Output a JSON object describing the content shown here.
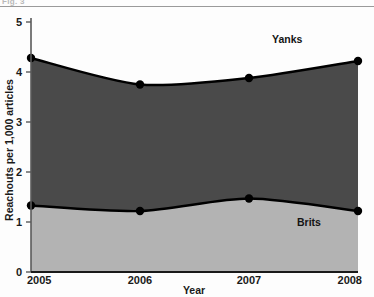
{
  "figure": {
    "caption_remnant": "Fig. 3",
    "background_color": "#fdfdfd"
  },
  "chart_data": {
    "type": "area",
    "stacked": true,
    "title": "",
    "subtitle": "",
    "xlabel": "Year",
    "ylabel": "Reachouts per 1,000 articles",
    "x": [
      2005,
      2006,
      2007,
      2008
    ],
    "xticklabels": [
      "2005",
      "2006",
      "2007",
      "2008"
    ],
    "yticklabels": [
      "0",
      "1",
      "2",
      "3",
      "4",
      "5"
    ],
    "yticks": [
      0,
      1,
      2,
      3,
      4,
      5
    ],
    "xlim": [
      2005,
      2008
    ],
    "ylim": [
      0,
      5
    ],
    "grid": false,
    "legend_position": "inline-annotation",
    "markers": "filled-circle",
    "series": [
      {
        "name": "Brits",
        "values": [
          1.33,
          1.22,
          1.47,
          1.22
        ],
        "color": "#b3b3b3",
        "line_color": "#000000",
        "label_x": 2007.55,
        "label_y": 0.92
      },
      {
        "name": "Yanks",
        "values": [
          4.28,
          3.75,
          3.88,
          4.22
        ],
        "color": "#4a4a4a",
        "line_color": "#000000",
        "label_x": 2007.35,
        "label_y": 4.58
      }
    ],
    "annotations": [
      {
        "text": "Yanks",
        "x": 2007.35,
        "y": 4.58
      },
      {
        "text": "Brits",
        "x": 2007.55,
        "y": 0.92
      }
    ],
    "colors": {
      "yanks_fill": "#4a4a4a",
      "brits_fill": "#b3b3b3",
      "line": "#000000",
      "axis": "#5a5a5a",
      "text": "#1a1a1a",
      "top_rule": "#9a9a9a"
    }
  }
}
